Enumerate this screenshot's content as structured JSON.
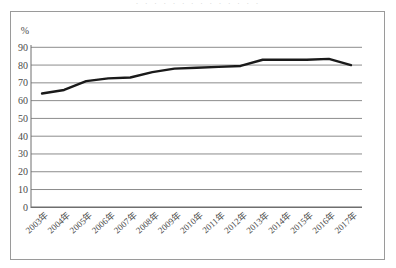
{
  "chart_data": {
    "type": "line",
    "title": "",
    "xlabel": "",
    "ylabel": "",
    "unit_label": "%",
    "ylim": [
      0,
      90
    ],
    "grid": true,
    "legend": "none",
    "categories": [
      "2003年",
      "2004年",
      "2005年",
      "2006年",
      "2007年",
      "2008年",
      "2009年",
      "2010年",
      "2011年",
      "2012年",
      "2013年",
      "2014年",
      "2015年",
      "2016年",
      "2017年"
    ],
    "values": [
      64,
      66,
      71,
      72.5,
      73,
      76,
      78,
      78.5,
      79,
      79.5,
      83,
      83,
      83,
      83.5,
      80
    ],
    "ytick_labels": [
      "90",
      "80",
      "70",
      "60",
      "50",
      "40",
      "30",
      "20",
      "10",
      "0"
    ],
    "yticks": [
      90,
      80,
      70,
      60,
      50,
      40,
      30,
      20,
      10,
      0
    ],
    "series": [
      {
        "name": "",
        "values": [
          64,
          66,
          71,
          72.5,
          73,
          76,
          78,
          78.5,
          79,
          79.5,
          83,
          83,
          83,
          83.5,
          80
        ],
        "color": "#1a1a1a",
        "line_width": 2.4
      }
    ]
  },
  "colors": {
    "line": "#1a1a1a",
    "gridline": "#8c8c8c",
    "axis": "#6e6e6e",
    "frame": "#9a9a9a",
    "tick_text": "#4a4a4a",
    "background": "#ffffff"
  },
  "title_fragment": {
    "text": "· · ·            · ·                              · ·     · · · · ·  · ·"
  }
}
